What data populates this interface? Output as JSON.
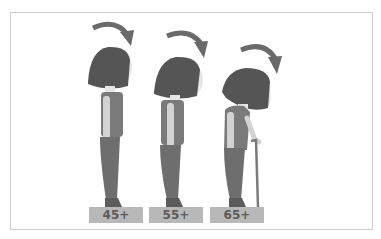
{
  "diagram": {
    "colors": {
      "hair": "#555555",
      "skin": "#e6e6e6",
      "shirt": "#7a7a7a",
      "sleeve": "#9a9a9a",
      "pants": "#6e6e6e",
      "arrow": "#6a6a6a",
      "cane": "#7a7a7a",
      "label_bg": "#b8b8b8",
      "label_text": "#5c5c5c",
      "frame_border": "#cfcfcf"
    },
    "figures": [
      {
        "age_label": "45+",
        "has_cane": false
      },
      {
        "age_label": "55+",
        "has_cane": false
      },
      {
        "age_label": "65+",
        "has_cane": true
      }
    ]
  }
}
